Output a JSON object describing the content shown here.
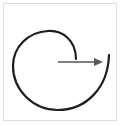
{
  "diagram": {
    "type": "spiral-arc-with-arrow",
    "elements": [
      {
        "name": "spiral-arc",
        "description": "open curved stroke looping counter-clockwise from inner top-right, around left and bottom, ending at right side"
      },
      {
        "name": "arrow",
        "description": "horizontal arrow pointing right from center toward the outer arc end"
      }
    ]
  },
  "colors": {
    "arc_stroke": "#1e1e1e",
    "arrow_stroke": "#555555",
    "frame_border": "#dcdcdc",
    "background": "#ffffff"
  }
}
